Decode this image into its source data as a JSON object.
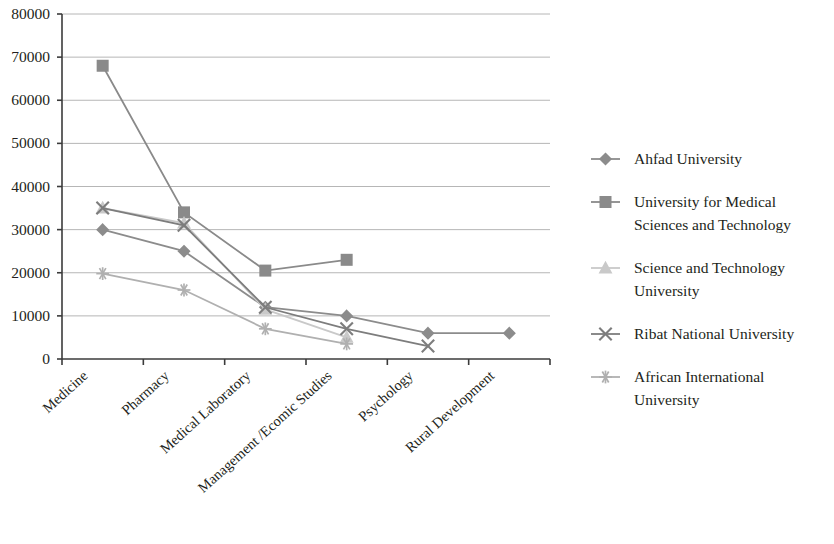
{
  "chart_data": {
    "type": "line",
    "title": "",
    "subtitle": "",
    "xlabel": "",
    "ylabel": "",
    "ylim": [
      0,
      80000
    ],
    "ytick_step": 10000,
    "ytick_labels": [
      "80000",
      "70000",
      "60000",
      "50000",
      "40000",
      "30000",
      "20000",
      "10000",
      "0"
    ],
    "ytick_values": [
      80000,
      70000,
      60000,
      50000,
      40000,
      30000,
      20000,
      10000,
      0
    ],
    "grid": "horizontal",
    "legend_position": "right",
    "categories": [
      "Medicine",
      "Pharmacy",
      "Medical Laboratory",
      "Management /Ecomic Studies",
      "Psychology",
      "Rural Development"
    ],
    "series": [
      {
        "name": "Ahfad University",
        "marker": "diamond",
        "color": "#8c8c8c",
        "values": [
          30000,
          25000,
          12000,
          10000,
          6000,
          6000
        ]
      },
      {
        "name": "University for Medical Sciences and Technology",
        "marker": "square",
        "color": "#8a8a8a",
        "values": [
          68000,
          34000,
          20500,
          23000,
          null,
          null
        ]
      },
      {
        "name": "Science and Technology University",
        "marker": "triangle",
        "color": "#c9c9c9",
        "values": [
          35000,
          31500,
          11500,
          5000,
          null,
          null
        ]
      },
      {
        "name": "Ribat National University",
        "marker": "cross",
        "color": "#7d7d7d",
        "values": [
          35000,
          31000,
          12000,
          7000,
          3000,
          null
        ]
      },
      {
        "name": "African International University",
        "marker": "asterisk",
        "color": "#b0b0b0",
        "values": [
          19800,
          16000,
          7000,
          3500,
          null,
          null
        ]
      }
    ]
  },
  "legend": {
    "items": [
      {
        "label": "Ahfad University",
        "marker": "diamond-marker-icon"
      },
      {
        "label": "University for Medical Sciences and Technology",
        "marker": "square-marker-icon"
      },
      {
        "label": "Science and Technology University",
        "marker": "triangle-marker-icon"
      },
      {
        "label": "Ribat National University",
        "marker": "cross-marker-icon"
      },
      {
        "label": "African International University",
        "marker": "asterisk-marker-icon"
      }
    ]
  }
}
